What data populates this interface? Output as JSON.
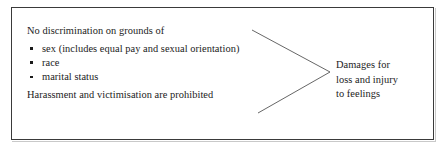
{
  "diagram": {
    "title_text": "No discrimination on grounds of",
    "left": {
      "lead": "No discrimination on grounds of",
      "bullets": [
        "sex (includes equal pay and sexual orientation)",
        "race",
        "marital status"
      ],
      "tail": "Harassment and victimisation are prohibited"
    },
    "right": {
      "lines": [
        "Damages for",
        "loss and injury",
        "to feelings"
      ]
    },
    "connector": {
      "upper_line": "diagonal-line-from-lead-to-vertex",
      "lower_line": "diagonal-line-from-tail-to-vertex",
      "vertex_label": "arrow-vertex"
    },
    "colors": {
      "text": "#1b1b1b",
      "border": "#3a3a3a",
      "line": "#3f3f3f",
      "background": "#ffffff"
    }
  }
}
